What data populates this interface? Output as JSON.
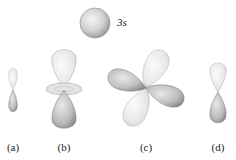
{
  "figure": {
    "sphere": {
      "label": "3s",
      "cx": 95,
      "cy": 23,
      "r": 15
    },
    "orbitals": [
      {
        "id": "a",
        "label": "(a)",
        "x": 13
      },
      {
        "id": "b",
        "label": "(b)",
        "x": 64
      },
      {
        "id": "c",
        "label": "(c)",
        "x": 146
      },
      {
        "id": "d",
        "label": "(d)",
        "x": 218
      }
    ],
    "colors": {
      "lobe_light": "#efefef",
      "lobe_dark": "#a9a9a9",
      "outline": "#8a8a8a"
    }
  }
}
